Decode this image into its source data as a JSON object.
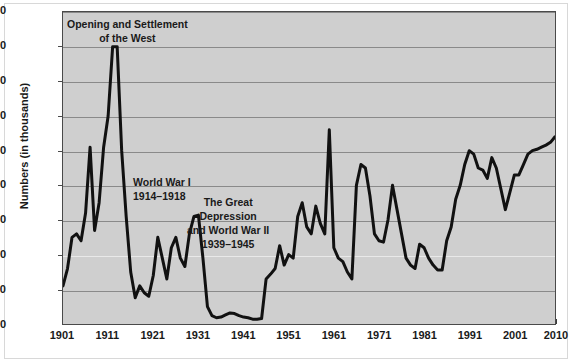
{
  "chart_data": {
    "type": "line",
    "title": "",
    "xlabel": "",
    "ylabel": "Numbers (in thousands)",
    "xlim": [
      1901,
      2010
    ],
    "ylim": [
      0,
      450
    ],
    "grid": true,
    "legend": "none",
    "ytick_labels": [
      "450",
      "400",
      "350",
      "300",
      "250",
      "200",
      "150",
      "100",
      "50",
      "0"
    ],
    "ytick_values": [
      450,
      400,
      350,
      300,
      250,
      200,
      150,
      100,
      50,
      0
    ],
    "xtick_labels": [
      "1901",
      "1911",
      "1921",
      "1931",
      "1941",
      "1951",
      "1961",
      "1971",
      "1981",
      "1991",
      "2001",
      "2010"
    ],
    "xtick_values": [
      1901,
      1911,
      1921,
      1931,
      1941,
      1951,
      1961,
      1971,
      1981,
      1991,
      2001,
      2010
    ],
    "series": [
      {
        "name": "Immigration",
        "color": "#111111",
        "x": [
          1901,
          1902,
          1903,
          1904,
          1905,
          1906,
          1907,
          1908,
          1909,
          1910,
          1911,
          1912,
          1913,
          1914,
          1915,
          1916,
          1917,
          1918,
          1919,
          1920,
          1921,
          1922,
          1923,
          1924,
          1925,
          1926,
          1927,
          1928,
          1929,
          1930,
          1931,
          1932,
          1933,
          1934,
          1935,
          1936,
          1937,
          1938,
          1939,
          1940,
          1941,
          1942,
          1943,
          1944,
          1945,
          1946,
          1947,
          1948,
          1949,
          1950,
          1951,
          1952,
          1953,
          1954,
          1955,
          1956,
          1957,
          1958,
          1959,
          1960,
          1961,
          1962,
          1963,
          1964,
          1965,
          1966,
          1967,
          1968,
          1969,
          1970,
          1971,
          1972,
          1973,
          1974,
          1975,
          1976,
          1977,
          1978,
          1979,
          1980,
          1981,
          1982,
          1983,
          1984,
          1985,
          1986,
          1987,
          1988,
          1989,
          1990,
          1991,
          1992,
          1993,
          1994,
          1995,
          1996,
          1997,
          1998,
          1999,
          2000,
          2001,
          2002,
          2003,
          2004,
          2005,
          2006,
          2007,
          2008,
          2009,
          2010
        ],
        "values": [
          55,
          80,
          125,
          130,
          120,
          160,
          255,
          135,
          175,
          255,
          300,
          400,
          400,
          250,
          155,
          75,
          38,
          55,
          45,
          40,
          70,
          125,
          95,
          65,
          110,
          125,
          95,
          83,
          130,
          155,
          157,
          95,
          25,
          12,
          9,
          10,
          13,
          16,
          15,
          12,
          10,
          9,
          7,
          7,
          8,
          65,
          72,
          80,
          113,
          85,
          100,
          95,
          155,
          175,
          140,
          130,
          170,
          145,
          130,
          280,
          110,
          95,
          90,
          75,
          65,
          200,
          230,
          225,
          185,
          130,
          120,
          118,
          150,
          200,
          165,
          130,
          95,
          85,
          80,
          115,
          110,
          95,
          85,
          78,
          78,
          120,
          140,
          180,
          200,
          230,
          250,
          245,
          225,
          222,
          210,
          240,
          225,
          195,
          165,
          190,
          215,
          215,
          230,
          245,
          250,
          252,
          255,
          258,
          262,
          270
        ]
      }
    ],
    "annotations": [
      {
        "id": "opening-west",
        "text_lines": [
          "Opening and Settlement",
          "of the West"
        ],
        "x_px": 66,
        "y_px": 17
      },
      {
        "id": "world-war-one",
        "text_lines": [
          "World War I",
          "1914–1918"
        ],
        "x_px": 132,
        "y_px": 175
      },
      {
        "id": "great-depression-ww2",
        "text_lines": [
          "The Great",
          "Depression",
          "and World War II",
          "1939–1945"
        ],
        "x_px": 186,
        "y_px": 195
      }
    ]
  }
}
